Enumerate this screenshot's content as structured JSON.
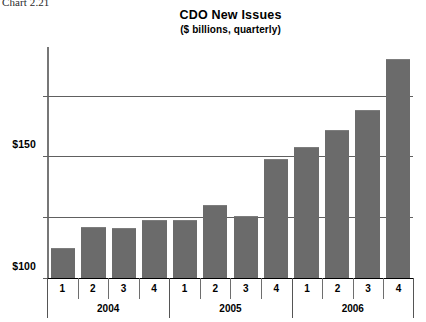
{
  "caption": "Chart 2.21",
  "chart_data": {
    "type": "bar",
    "title": "CDO New Issues",
    "subtitle": "($ billions, quarterly)",
    "xlabel": "",
    "ylabel": "",
    "ylim": [
      0,
      190
    ],
    "grid": true,
    "legend": null,
    "bar_color": "#6b6b6b",
    "ytick_values": [
      0,
      50,
      100,
      150
    ],
    "ytick_labels": [
      "$0",
      "$50",
      "$100",
      "$150"
    ],
    "categories": [
      "1",
      "2",
      "3",
      "4",
      "1",
      "2",
      "3",
      "4",
      "1",
      "2",
      "3",
      "4"
    ],
    "groups": [
      {
        "label": "2004",
        "quarters": [
          "1",
          "2",
          "3",
          "4"
        ]
      },
      {
        "label": "2005",
        "quarters": [
          "1",
          "2",
          "3",
          "4"
        ]
      },
      {
        "label": "2006",
        "quarters": [
          "1",
          "2",
          "3",
          "4"
        ]
      }
    ],
    "values": [
      25,
      42,
      41,
      48,
      48,
      60,
      51,
      98,
      108,
      122,
      138,
      180
    ],
    "points": [
      {
        "year": "2004",
        "quarter": "1",
        "value": 25
      },
      {
        "year": "2004",
        "quarter": "2",
        "value": 42
      },
      {
        "year": "2004",
        "quarter": "3",
        "value": 41
      },
      {
        "year": "2004",
        "quarter": "4",
        "value": 48
      },
      {
        "year": "2005",
        "quarter": "1",
        "value": 48
      },
      {
        "year": "2005",
        "quarter": "2",
        "value": 60
      },
      {
        "year": "2005",
        "quarter": "3",
        "value": 51
      },
      {
        "year": "2005",
        "quarter": "4",
        "value": 98
      },
      {
        "year": "2006",
        "quarter": "1",
        "value": 108
      },
      {
        "year": "2006",
        "quarter": "2",
        "value": 122
      },
      {
        "year": "2006",
        "quarter": "3",
        "value": 138
      },
      {
        "year": "2006",
        "quarter": "4",
        "value": 180
      }
    ]
  }
}
